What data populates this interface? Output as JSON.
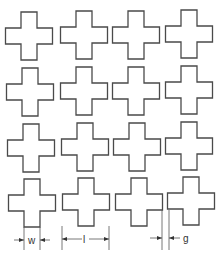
{
  "diagram": {
    "title": "",
    "grid": {
      "rows": 4,
      "columns": 4,
      "element": "cross-shaped patch"
    },
    "cross_geometry": {
      "arm_span_px": 47,
      "arm_width_px": 16
    },
    "crosses": [
      {
        "row": 1,
        "col": 1,
        "cx": 29,
        "cy": 36
      },
      {
        "row": 1,
        "col": 2,
        "cx": 84,
        "cy": 35
      },
      {
        "row": 1,
        "col": 3,
        "cx": 136,
        "cy": 35
      },
      {
        "row": 1,
        "col": 4,
        "cx": 189,
        "cy": 34
      },
      {
        "row": 2,
        "col": 1,
        "cx": 30,
        "cy": 92
      },
      {
        "row": 2,
        "col": 2,
        "cx": 84,
        "cy": 91
      },
      {
        "row": 2,
        "col": 3,
        "cx": 136,
        "cy": 91
      },
      {
        "row": 2,
        "col": 4,
        "cx": 189,
        "cy": 90
      },
      {
        "row": 3,
        "col": 1,
        "cx": 31,
        "cy": 148
      },
      {
        "row": 3,
        "col": 2,
        "cx": 85,
        "cy": 147
      },
      {
        "row": 3,
        "col": 3,
        "cx": 137,
        "cy": 147
      },
      {
        "row": 3,
        "col": 4,
        "cx": 189,
        "cy": 146
      },
      {
        "row": 4,
        "col": 1,
        "cx": 32,
        "cy": 203
      },
      {
        "row": 4,
        "col": 2,
        "cx": 86,
        "cy": 202
      },
      {
        "row": 4,
        "col": 3,
        "cx": 139,
        "cy": 202
      },
      {
        "row": 4,
        "col": 4,
        "cx": 191,
        "cy": 201
      }
    ],
    "dimensions": [
      {
        "label": "w",
        "meaning": "arm width",
        "x1": 24,
        "x2": 40,
        "arrows": "outside"
      },
      {
        "label": "l",
        "meaning": "arm length (span)",
        "x1": 62,
        "x2": 109,
        "arrows": "inside"
      },
      {
        "label": "g",
        "meaning": "gap between patches",
        "x1": 162,
        "x2": 169,
        "arrows": "outside"
      }
    ]
  }
}
